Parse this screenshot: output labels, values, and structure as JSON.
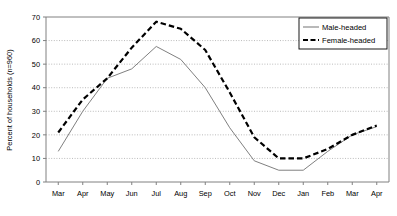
{
  "chart_data": {
    "type": "line",
    "title": "",
    "xlabel": "",
    "ylabel": "Percent of households (n=960)",
    "categories": [
      "Mar",
      "Apr",
      "May",
      "Jun",
      "Jul",
      "Aug",
      "Sep",
      "Oct",
      "Nov",
      "Dec",
      "Jan",
      "Feb",
      "Mar",
      "Apr"
    ],
    "ylim": [
      0,
      70
    ],
    "yticks": [
      0,
      10,
      20,
      30,
      40,
      50,
      60,
      70
    ],
    "ytick_labels": [
      "0",
      "10",
      "20",
      "30",
      "40",
      "50",
      "60",
      "70"
    ],
    "grid": true,
    "grid_style": "dotted-horizontal",
    "legend_position": "top-right-inside",
    "series": [
      {
        "name": "Male-headed",
        "style": "solid",
        "color": "#808080",
        "values": [
          13,
          30,
          44,
          48,
          57.5,
          52,
          40,
          23,
          9,
          5,
          5,
          13,
          20,
          23.5
        ]
      },
      {
        "name": "Female-headed",
        "style": "dashed",
        "color": "#000000",
        "values": [
          21,
          35,
          44,
          57,
          68,
          65,
          56,
          38,
          19,
          10,
          10,
          14,
          20,
          24
        ]
      }
    ]
  },
  "legend": {
    "items": [
      {
        "label": "Male-headed",
        "style": "solid"
      },
      {
        "label": "Female-headed",
        "style": "dashed"
      }
    ]
  },
  "colors": {
    "male_line": "#808080",
    "female_line": "#000000",
    "grid": "#aaaaaa",
    "axis": "#808080",
    "background": "#ffffff"
  }
}
